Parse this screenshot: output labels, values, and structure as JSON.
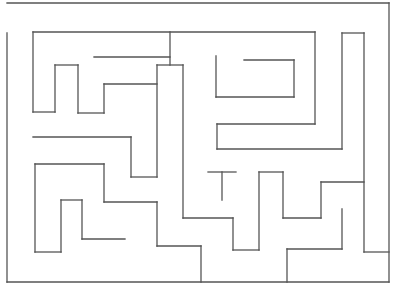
{
  "image": {
    "type": "maze",
    "width": 394,
    "height": 299,
    "background": "#ffffff",
    "stroke_color": "#555555"
  },
  "walls": [
    [
      7,
      3,
      389,
      3
    ],
    [
      389,
      3,
      389,
      282
    ],
    [
      7,
      33,
      7,
      282
    ],
    [
      7,
      282,
      389,
      282
    ],
    [
      33,
      32,
      315,
      32
    ],
    [
      33,
      32,
      33,
      112
    ],
    [
      33,
      112,
      55,
      112
    ],
    [
      55,
      65,
      55,
      112
    ],
    [
      55,
      65,
      78,
      65
    ],
    [
      78,
      65,
      78,
      113
    ],
    [
      78,
      113,
      104,
      113
    ],
    [
      104,
      84,
      104,
      113
    ],
    [
      104,
      84,
      157,
      84
    ],
    [
      94,
      57,
      170,
      57
    ],
    [
      170,
      32,
      170,
      65
    ],
    [
      157,
      65,
      183,
      65
    ],
    [
      157,
      65,
      157,
      177
    ],
    [
      131,
      137,
      131,
      177
    ],
    [
      131,
      177,
      157,
      177
    ],
    [
      33,
      137,
      131,
      137
    ],
    [
      183,
      65,
      183,
      218
    ],
    [
      183,
      218,
      233,
      218
    ],
    [
      233,
      218,
      233,
      250
    ],
    [
      233,
      250,
      259,
      250
    ],
    [
      259,
      172,
      259,
      250
    ],
    [
      259,
      172,
      283,
      172
    ],
    [
      283,
      172,
      283,
      218
    ],
    [
      283,
      218,
      321,
      218
    ],
    [
      321,
      182,
      321,
      218
    ],
    [
      321,
      182,
      364,
      182
    ],
    [
      315,
      32,
      315,
      124
    ],
    [
      217,
      124,
      315,
      124
    ],
    [
      217,
      124,
      217,
      149
    ],
    [
      217,
      149,
      342,
      149
    ],
    [
      342,
      33,
      342,
      149
    ],
    [
      216,
      56,
      216,
      97
    ],
    [
      216,
      97,
      294,
      97
    ],
    [
      294,
      60,
      294,
      97
    ],
    [
      244,
      60,
      294,
      60
    ],
    [
      342,
      33,
      364,
      33
    ],
    [
      364,
      33,
      364,
      252
    ],
    [
      364,
      252,
      389,
      252
    ],
    [
      208,
      172,
      236,
      172
    ],
    [
      222,
      172,
      222,
      200
    ],
    [
      287,
      249,
      287,
      282
    ],
    [
      287,
      249,
      342,
      249
    ],
    [
      342,
      209,
      342,
      249
    ],
    [
      35,
      164,
      35,
      252
    ],
    [
      35,
      164,
      104,
      164
    ],
    [
      104,
      164,
      104,
      202
    ],
    [
      104,
      202,
      157,
      202
    ],
    [
      157,
      202,
      157,
      246
    ],
    [
      157,
      246,
      201,
      246
    ],
    [
      201,
      246,
      201,
      282
    ],
    [
      61,
      200,
      61,
      252
    ],
    [
      35,
      252,
      61,
      252
    ],
    [
      61,
      200,
      82,
      200
    ],
    [
      82,
      200,
      82,
      239
    ],
    [
      82,
      239,
      125,
      239
    ]
  ]
}
